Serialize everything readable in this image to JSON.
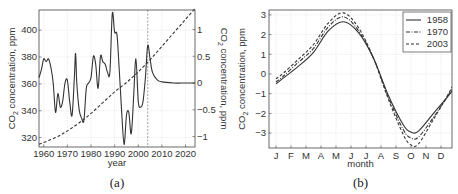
{
  "chart_data": [
    {
      "type": "line",
      "caption": "(a)",
      "xlabel": "year",
      "ylabel": "CO2 concentration, ppm",
      "ylabel_right": "CO2 concentration, ppm",
      "xlim": [
        1958,
        2024
      ],
      "ylim": [
        313,
        415
      ],
      "ylim_right": [
        -1.2,
        1.3
      ],
      "xticks": [
        1960,
        1970,
        1980,
        1990,
        2000,
        2010,
        2020
      ],
      "yticks": [
        320,
        340,
        360,
        380,
        400
      ],
      "yticks_right": [
        -1,
        -0.5,
        0,
        0.5,
        1
      ],
      "ytick_labels_right": [
        "−1",
        "−0.5",
        "0",
        "0.5",
        "1"
      ],
      "vertical_marker_x": 2004,
      "grid": true,
      "series": [
        {
          "name": "trend (left axis)",
          "style": "dashed",
          "x": [
            1958,
            1965,
            1970,
            1975,
            1980,
            1985,
            1990,
            1995,
            2000,
            2005,
            2010,
            2015,
            2020,
            2024
          ],
          "y": [
            315,
            320,
            325,
            331,
            338,
            346,
            354,
            361,
            369,
            378,
            388,
            398,
            408,
            416
          ]
        },
        {
          "name": "residual (right axis)",
          "style": "solid",
          "x": [
            1958,
            1959,
            1960,
            1961,
            1962,
            1963,
            1964,
            1965,
            1966,
            1967,
            1968,
            1969,
            1970,
            1971,
            1972,
            1973,
            1973.5,
            1974,
            1975,
            1976,
            1977,
            1978,
            1979,
            1980,
            1981,
            1982,
            1983,
            1984,
            1985,
            1986,
            1987,
            1988,
            1989,
            1990,
            1991,
            1992,
            1993,
            1994,
            1995,
            1996,
            1997,
            1998,
            1999,
            2000,
            2001,
            2002,
            2003,
            2004,
            2005,
            2006,
            2008,
            2010,
            2015,
            2020,
            2024
          ],
          "y": [
            0.1,
            0.25,
            0.45,
            0.4,
            0.45,
            0.3,
            0.0,
            -0.55,
            -0.2,
            -0.45,
            -0.35,
            0.0,
            0.05,
            -0.35,
            -0.6,
            0.15,
            0.55,
            0.0,
            -0.5,
            -0.65,
            -0.7,
            -0.1,
            0.0,
            0.1,
            0.5,
            0.35,
            -0.1,
            0.5,
            0.4,
            0.35,
            0.2,
            0.2,
            1.3,
            0.95,
            0.9,
            0.2,
            -0.55,
            -1.15,
            -0.6,
            -0.55,
            -0.95,
            -0.3,
            0.45,
            -0.35,
            -0.45,
            -0.35,
            0.1,
            0.7,
            0.45,
            0.2,
            0.06,
            0.02,
            0.0,
            0.0,
            0.0
          ]
        }
      ]
    },
    {
      "type": "line",
      "caption": "(b)",
      "xlabel": "month",
      "ylabel": "CO2 concentration, ppm",
      "categories": [
        "J",
        "F",
        "M",
        "A",
        "M",
        "J",
        "J",
        "A",
        "S",
        "O",
        "N",
        "D"
      ],
      "ylim": [
        -3.75,
        3.25
      ],
      "yticks": [
        -3,
        -2,
        -1,
        0,
        1,
        2,
        3
      ],
      "ytick_labels": [
        "−3",
        "−2",
        "−1",
        "0",
        "1",
        "2",
        "3"
      ],
      "grid": true,
      "legend": {
        "position": "upper right",
        "entries": [
          "1958",
          "1970",
          "2003"
        ]
      },
      "series": [
        {
          "name": "1958",
          "style": "solid",
          "x": [
            0.5,
            1,
            2,
            3,
            4,
            5,
            6,
            7,
            8,
            9,
            9.5,
            10,
            11,
            12,
            12.5
          ],
          "y": [
            -0.5,
            -0.2,
            0.4,
            1.1,
            2.2,
            2.65,
            2.1,
            0.8,
            -1.1,
            -2.6,
            -2.95,
            -2.9,
            -2.0,
            -1.1,
            -0.55
          ]
        },
        {
          "name": "1970",
          "style": "dashdot",
          "x": [
            0.5,
            1,
            2,
            3,
            4,
            5,
            6,
            7,
            8,
            9,
            9.5,
            10,
            11,
            12,
            12.5
          ],
          "y": [
            -0.4,
            -0.1,
            0.6,
            1.3,
            2.4,
            2.9,
            2.2,
            0.8,
            -1.2,
            -2.85,
            -3.25,
            -3.2,
            -2.2,
            -1.05,
            -0.35
          ]
        },
        {
          "name": "2003",
          "style": "dashed",
          "x": [
            0.5,
            1,
            2,
            3,
            4,
            5,
            6,
            7,
            8,
            9,
            9.5,
            10,
            11,
            12,
            12.5
          ],
          "y": [
            -0.25,
            0.05,
            0.75,
            1.5,
            2.6,
            3.1,
            2.35,
            0.8,
            -1.3,
            -3.1,
            -3.6,
            -3.55,
            -2.3,
            -1.0,
            -0.25
          ]
        }
      ]
    }
  ]
}
